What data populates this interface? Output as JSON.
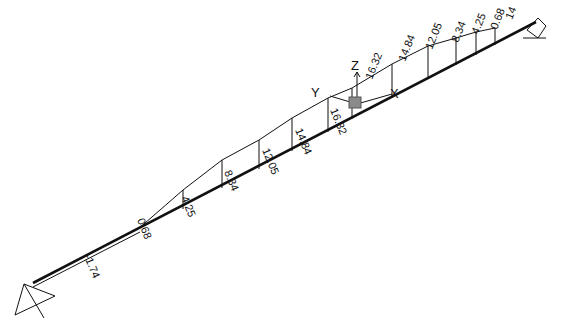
{
  "diagram": {
    "type": "moment-diagram-3d",
    "background": "#ffffff",
    "line_color": "#111111",
    "axes": {
      "x_label": "X",
      "y_label": "Y",
      "z_label": "Z"
    },
    "labels": [
      {
        "text": "-1.74",
        "x": 84,
        "y": 256,
        "rot": 68
      },
      {
        "text": "0.68",
        "x": 137,
        "y": 220,
        "rot": 68
      },
      {
        "text": "4.25",
        "x": 181,
        "y": 198,
        "rot": 68
      },
      {
        "text": "8.34",
        "x": 224,
        "y": 172,
        "rot": 68
      },
      {
        "text": "12.05",
        "x": 262,
        "y": 150,
        "rot": 68
      },
      {
        "text": "14.84",
        "x": 295,
        "y": 130,
        "rot": 68
      },
      {
        "text": "16.32",
        "x": 330,
        "y": 110,
        "rot": 68
      },
      {
        "text": "16.32",
        "x": 372,
        "y": 80,
        "rot": -68
      },
      {
        "text": "14.84",
        "x": 405,
        "y": 62,
        "rot": -68
      },
      {
        "text": "12.05",
        "x": 432,
        "y": 50,
        "rot": -68
      },
      {
        "text": "8.34",
        "x": 458,
        "y": 43,
        "rot": -68
      },
      {
        "text": "4.25",
        "x": 478,
        "y": 35,
        "rot": -68
      },
      {
        "text": "0.68",
        "x": 497,
        "y": 30,
        "rot": -68
      },
      {
        "text": "14",
        "x": 512,
        "y": 20,
        "rot": -68
      }
    ]
  }
}
